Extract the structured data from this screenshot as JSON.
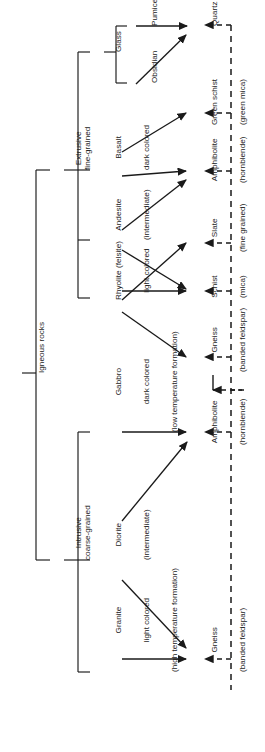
{
  "diagram": {
    "orientation": "rotated-90-ccw",
    "root": {
      "label": "Igneous rocks"
    },
    "groups": [
      {
        "id": "extrusive",
        "label": "Extrusive\nfine-grained"
      },
      {
        "id": "intrusive",
        "label": "Intrusive\ncoarse-grained"
      }
    ],
    "igneous_rocks": [
      {
        "id": "glass",
        "line1": "Glass",
        "line2": "",
        "line3": ""
      },
      {
        "id": "pumice",
        "line1": "Pumice",
        "line2": "",
        "line3": ""
      },
      {
        "id": "obsidian",
        "line1": "Obsidian",
        "line2": "",
        "line3": ""
      },
      {
        "id": "basalt",
        "line1": "Basalt",
        "line2": "dark colored",
        "line3": ""
      },
      {
        "id": "andesite",
        "line1": "Andesite",
        "line2": "(intermediate)",
        "line3": ""
      },
      {
        "id": "rhyolite",
        "line1": "Rhyolite (felsite)",
        "line2": "light colored",
        "line3": ""
      },
      {
        "id": "gabbro",
        "line1": "Gabbro",
        "line2": "dark colored",
        "line3": "(low temperature formation)"
      },
      {
        "id": "diorite",
        "line1": "Diorite",
        "line2": "(intermediate)",
        "line3": ""
      },
      {
        "id": "granite",
        "line1": "Granite",
        "line2": "light colored",
        "line3": "(high temperature formation)"
      }
    ],
    "metamorphic_rocks": [
      {
        "id": "quartz",
        "line1": "Quartz",
        "line2": ""
      },
      {
        "id": "greenschist",
        "line1": "Green schist",
        "line2": "(green mica)"
      },
      {
        "id": "amphibolite1",
        "line1": "Amphibolite",
        "line2": "(hornblende)"
      },
      {
        "id": "slate",
        "line1": "Slate",
        "line2": "(fine grained)"
      },
      {
        "id": "schist",
        "line1": "Schist",
        "line2": "(mica)"
      },
      {
        "id": "gneiss1",
        "line1": "Gneiss",
        "line2": "(banded feldspar)"
      },
      {
        "id": "amphibolite2",
        "line1": "Amphibolite",
        "line2": "(hornblende)"
      },
      {
        "id": "gneiss2",
        "line1": "Gneiss",
        "line2": "(banded feldspar)"
      }
    ],
    "metamorphic_group": {
      "label": "Metamorphic rocks"
    },
    "colors": {
      "line": "#1a1a1a",
      "text": "#1a1a1a",
      "background": "#ffffff"
    }
  }
}
